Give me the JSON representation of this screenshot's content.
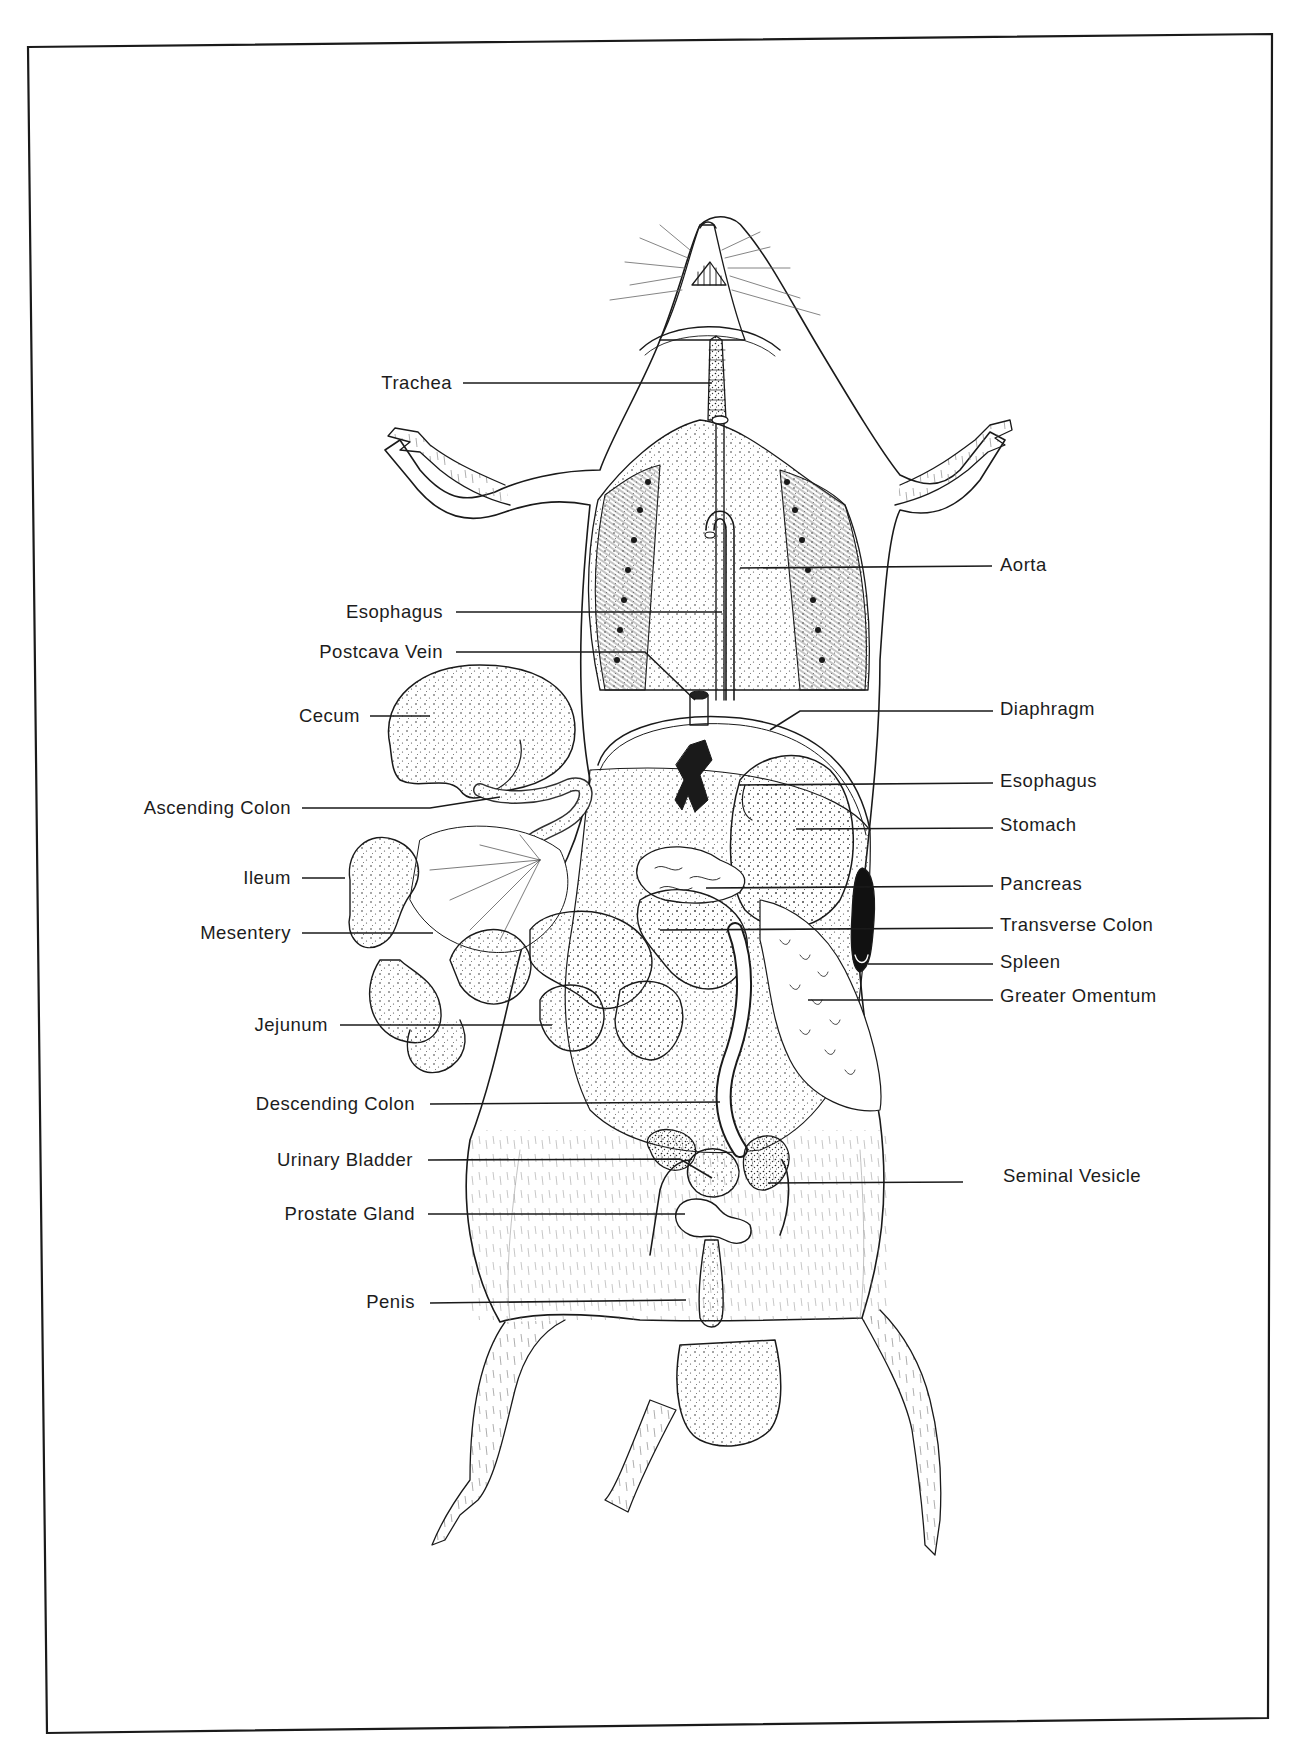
{
  "figure": {
    "frame_color": "#1a1a1a",
    "ink_color": "#1a1a1a",
    "background_color": "#ffffff"
  },
  "labels_left": [
    {
      "id": "trachea",
      "text": "Trachea",
      "x_right": 452,
      "y": 383,
      "line": [
        [
          463,
          383
        ],
        [
          712,
          383
        ]
      ]
    },
    {
      "id": "esophagus-upper",
      "text": "Esophagus",
      "x_right": 443,
      "y": 612,
      "line": [
        [
          456,
          612
        ],
        [
          722,
          612
        ]
      ]
    },
    {
      "id": "postcava-vein",
      "text": "Postcava Vein",
      "x_right": 443,
      "y": 652,
      "line": [
        [
          456,
          652
        ],
        [
          645,
          652
        ],
        [
          695,
          700
        ]
      ]
    },
    {
      "id": "cecum",
      "text": "Cecum",
      "x_right": 360,
      "y": 716,
      "line": [
        [
          370,
          716
        ],
        [
          430,
          716
        ]
      ]
    },
    {
      "id": "ascending-colon",
      "text": "Ascending Colon",
      "x_right": 291,
      "y": 808,
      "line": [
        [
          302,
          808
        ],
        [
          430,
          808
        ],
        [
          500,
          797
        ]
      ]
    },
    {
      "id": "ileum",
      "text": "Ileum",
      "x_right": 291,
      "y": 878,
      "line": [
        [
          302,
          878
        ],
        [
          345,
          878
        ]
      ]
    },
    {
      "id": "mesentery",
      "text": "Mesentery",
      "x_right": 291,
      "y": 933,
      "line": [
        [
          302,
          933
        ],
        [
          433,
          933
        ]
      ]
    },
    {
      "id": "jejunum",
      "text": "Jejunum",
      "x_right": 328,
      "y": 1025,
      "line": [
        [
          340,
          1025
        ],
        [
          552,
          1025
        ]
      ]
    },
    {
      "id": "descending-colon",
      "text": "Descending Colon",
      "x_right": 415,
      "y": 1104,
      "line": [
        [
          430,
          1104
        ],
        [
          720,
          1102
        ]
      ]
    },
    {
      "id": "urinary-bladder",
      "text": "Urinary Bladder",
      "x_right": 413,
      "y": 1160,
      "line": [
        [
          428,
          1160
        ],
        [
          680,
          1159
        ],
        [
          712,
          1178
        ]
      ]
    },
    {
      "id": "prostate-gland",
      "text": "Prostate Gland",
      "x_right": 415,
      "y": 1214,
      "line": [
        [
          428,
          1214
        ],
        [
          685,
          1214
        ]
      ]
    },
    {
      "id": "penis",
      "text": "Penis",
      "x_right": 415,
      "y": 1302,
      "line": [
        [
          430,
          1303
        ],
        [
          686,
          1300
        ]
      ]
    }
  ],
  "labels_right": [
    {
      "id": "aorta",
      "text": "Aorta",
      "x_left": 1000,
      "y": 565,
      "line": [
        [
          740,
          568
        ],
        [
          992,
          566
        ]
      ]
    },
    {
      "id": "diaphragm",
      "text": "Diaphragm",
      "x_left": 1000,
      "y": 709,
      "line": [
        [
          770,
          730
        ],
        [
          800,
          711
        ],
        [
          993,
          711
        ]
      ]
    },
    {
      "id": "esophagus-lower",
      "text": "Esophagus",
      "x_left": 1000,
      "y": 781,
      "line": [
        [
          740,
          785
        ],
        [
          993,
          783
        ]
      ]
    },
    {
      "id": "stomach",
      "text": "Stomach",
      "x_left": 1000,
      "y": 825,
      "line": [
        [
          796,
          829
        ],
        [
          993,
          828
        ]
      ]
    },
    {
      "id": "pancreas",
      "text": "Pancreas",
      "x_left": 1000,
      "y": 884,
      "line": [
        [
          706,
          888
        ],
        [
          993,
          886
        ]
      ]
    },
    {
      "id": "transverse-colon",
      "text": "Transverse Colon",
      "x_left": 1000,
      "y": 925,
      "line": [
        [
          660,
          930
        ],
        [
          993,
          928
        ]
      ]
    },
    {
      "id": "spleen",
      "text": "Spleen",
      "x_left": 1000,
      "y": 962,
      "line": [
        [
          868,
          964
        ],
        [
          993,
          964
        ]
      ]
    },
    {
      "id": "greater-omentum",
      "text": "Greater Omentum",
      "x_left": 1000,
      "y": 996,
      "line": [
        [
          808,
          1000
        ],
        [
          993,
          1000
        ]
      ]
    },
    {
      "id": "seminal-vesicle",
      "text": "Seminal Vesicle",
      "x_left": 1003,
      "y": 1176,
      "line": [
        [
          768,
          1183
        ],
        [
          963,
          1182
        ]
      ]
    }
  ]
}
